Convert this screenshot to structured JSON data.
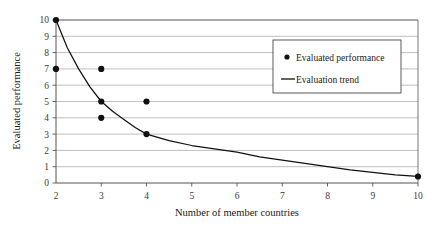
{
  "chart_data": {
    "type": "scatter",
    "title": "",
    "xlabel": "Number of member countries",
    "ylabel": "Evaluated performance",
    "xlim": [
      2,
      10
    ],
    "ylim": [
      0,
      10
    ],
    "xticks": [
      "2",
      "3",
      "4",
      "5",
      "6",
      "7",
      "8",
      "9",
      "10"
    ],
    "yticks": [
      "0",
      "1",
      "2",
      "3",
      "4",
      "5",
      "6",
      "7",
      "8",
      "9",
      "10"
    ],
    "grid": "horizontal",
    "grid_color": "#b4b4b4",
    "legend_position": "upper-right",
    "series": [
      {
        "name": "Evaluated performance",
        "type": "scatter",
        "marker": "filled-circle",
        "color": "#111111",
        "points": [
          {
            "x": 2,
            "y": 10
          },
          {
            "x": 2,
            "y": 7
          },
          {
            "x": 3,
            "y": 7
          },
          {
            "x": 3,
            "y": 5
          },
          {
            "x": 3,
            "y": 4
          },
          {
            "x": 4,
            "y": 5
          },
          {
            "x": 4,
            "y": 3
          },
          {
            "x": 10,
            "y": 0.4
          }
        ]
      },
      {
        "name": "Evaluation trend",
        "type": "line",
        "color": "#111111",
        "points": [
          {
            "x": 2,
            "y": 10
          },
          {
            "x": 2.25,
            "y": 8.3
          },
          {
            "x": 2.5,
            "y": 7.0
          },
          {
            "x": 2.75,
            "y": 5.9
          },
          {
            "x": 3,
            "y": 5.0
          },
          {
            "x": 3.25,
            "y": 4.4
          },
          {
            "x": 3.5,
            "y": 3.9
          },
          {
            "x": 3.75,
            "y": 3.4
          },
          {
            "x": 4,
            "y": 3.0
          },
          {
            "x": 4.5,
            "y": 2.6
          },
          {
            "x": 5,
            "y": 2.3
          },
          {
            "x": 5.5,
            "y": 2.1
          },
          {
            "x": 6,
            "y": 1.9
          },
          {
            "x": 6.5,
            "y": 1.6
          },
          {
            "x": 7,
            "y": 1.4
          },
          {
            "x": 7.5,
            "y": 1.2
          },
          {
            "x": 8,
            "y": 1.0
          },
          {
            "x": 8.5,
            "y": 0.8
          },
          {
            "x": 9,
            "y": 0.65
          },
          {
            "x": 9.5,
            "y": 0.5
          },
          {
            "x": 10,
            "y": 0.4
          }
        ]
      }
    ]
  },
  "legend": {
    "entries": [
      {
        "label": "Evaluated performance",
        "marker": "dot"
      },
      {
        "label": "Evaluation trend",
        "marker": "line"
      }
    ]
  }
}
